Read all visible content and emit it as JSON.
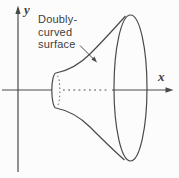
{
  "diagram": {
    "annotation": {
      "lines": [
        "Doubly-",
        "curved",
        "surface"
      ]
    },
    "axes": {
      "x_label": "x",
      "y_label": "y"
    },
    "colors": {
      "line": "#4a4a4a",
      "text": "#3e3e3e",
      "background": "#fcfcfc"
    }
  }
}
